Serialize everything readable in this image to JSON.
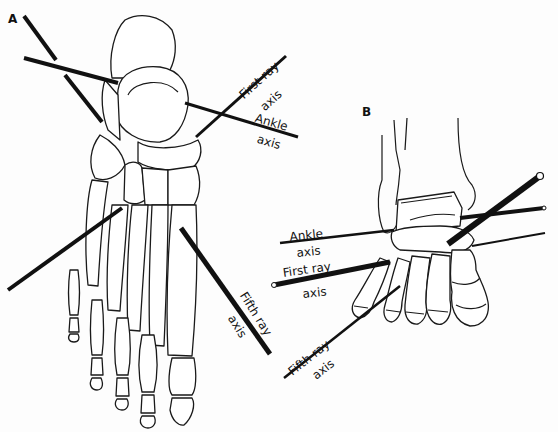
{
  "figure": {
    "panels": [
      {
        "id": "A",
        "label": "A"
      },
      {
        "id": "B",
        "label": "B"
      }
    ],
    "panel_a": {
      "labels": {
        "first_ray": "First ray",
        "first_ray_axis": "axis",
        "ankle": "Ankle",
        "ankle_axis": "axis",
        "fifth_ray": "Fifth ray",
        "fifth_ray_axis": "axis"
      }
    },
    "panel_b": {
      "labels": {
        "ankle": "Ankle",
        "ankle_axis": "axis",
        "first_ray": "First ray",
        "first_ray_axis": "axis",
        "fifth_ray": "Fifth ray",
        "fifth_ray_axis": "axis"
      }
    },
    "colors": {
      "line": "#111111",
      "background": "#fdfdfd"
    }
  }
}
